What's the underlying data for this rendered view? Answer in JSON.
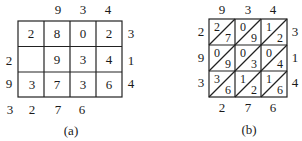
{
  "figure_a": {
    "caption": "(a)",
    "top_labels": [
      "9",
      "3",
      "4"
    ],
    "right_labels": [
      "3",
      "1",
      "4"
    ],
    "left_labels": [
      "",
      "2",
      "9"
    ],
    "bottom_labels": [
      "3",
      "2",
      "7",
      "6"
    ],
    "cells": [
      [
        "2",
        "8",
        "0",
        "2"
      ],
      [
        "",
        "9",
        "3",
        "4"
      ],
      [
        "3",
        "7",
        "3",
        "6"
      ]
    ]
  },
  "figure_b": {
    "caption": "(b)",
    "top_labels": [
      "9",
      "3",
      "4"
    ],
    "left_labels": [
      "2",
      "9",
      "3"
    ],
    "right_labels": [
      "3",
      "1",
      "4"
    ],
    "bottom_labels": [
      "2",
      "7",
      "6"
    ],
    "cells": [
      [
        {
          "upper": "2",
          "lower": "7"
        },
        {
          "upper": "0",
          "lower": "9"
        },
        {
          "upper": "1",
          "lower": "2"
        }
      ],
      [
        {
          "upper": "0",
          "lower": "9"
        },
        {
          "upper": "0",
          "lower": "3"
        },
        {
          "upper": "0",
          "lower": "4"
        }
      ],
      [
        {
          "upper": "3",
          "lower": "6"
        },
        {
          "upper": "1",
          "lower": "2"
        },
        {
          "upper": "1",
          "lower": "6"
        }
      ]
    ]
  }
}
